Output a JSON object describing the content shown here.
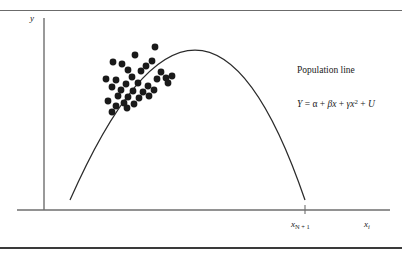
{
  "figure": {
    "axes": {
      "y_label": "y",
      "x_label_main": "x",
      "x_label_main_sub": "i",
      "x_tick_label": "x",
      "x_tick_label_sub": "N + 1"
    },
    "annotations": {
      "curve_caption": "Population line",
      "equation": "Y = α + βx + γx² + U",
      "equation_lhs": "Y",
      "equation_eq": "=",
      "equation_alpha": "α",
      "equation_plus1": "+",
      "equation_beta_x": "βx",
      "equation_plus2": "+",
      "equation_gamma_x": "γx",
      "equation_exponent": "2",
      "equation_plus3": "+",
      "equation_error": "U"
    },
    "colors": {
      "ink": "#1a1a1a",
      "axis": "#6e6e6e",
      "curve": "#2b2b2b",
      "point": "#1a1a1a",
      "rule": "#4a4a4a"
    }
  },
  "chart_data": {
    "type": "scatter",
    "title": "",
    "subtitle": "",
    "xlabel": "x_i",
    "ylabel": "y",
    "grid": false,
    "legend_position": "none",
    "axis_pixel_geometry": {
      "y_axis_x": 44,
      "y_axis_top": 18,
      "y_axis_bottom": 210,
      "x_axis_y": 210,
      "x_axis_left": 17,
      "x_axis_right": 390,
      "x_tick_pixel": 305
    },
    "annotations": [
      {
        "text": "Population line",
        "x": 297,
        "y": 66
      },
      {
        "text": "Y = α + βx + γx² + U",
        "x": 297,
        "y": 99
      }
    ],
    "series": [
      {
        "name": "Population line",
        "type": "line",
        "curve_form": "quadratic",
        "equation": "Y = α + βx + γx² + U",
        "pixel_path": {
          "start": [
            70,
            200
          ],
          "vertex": [
            195,
            50
          ],
          "end": [
            305,
            200
          ]
        },
        "points": [
          [
            70,
            200
          ],
          [
            80,
            172
          ],
          [
            90,
            148
          ],
          [
            100,
            127
          ],
          [
            110,
            109
          ],
          [
            120,
            93
          ],
          [
            130,
            80
          ],
          [
            140,
            70
          ],
          [
            150,
            62
          ],
          [
            160,
            56
          ],
          [
            170,
            52
          ],
          [
            180,
            50
          ],
          [
            190,
            49
          ],
          [
            200,
            50
          ],
          [
            210,
            53
          ],
          [
            220,
            58
          ],
          [
            230,
            65
          ],
          [
            240,
            74
          ],
          [
            250,
            86
          ],
          [
            260,
            100
          ],
          [
            270,
            117
          ],
          [
            280,
            137
          ],
          [
            290,
            160
          ],
          [
            298,
            180
          ],
          [
            305,
            200
          ]
        ]
      },
      {
        "name": "Sample observations",
        "type": "scatter",
        "marker": "filled-circle",
        "marker_size_px": 3.4,
        "count": 34,
        "points": [
          [
            155,
            47
          ],
          [
            135,
            55
          ],
          [
            113,
            62
          ],
          [
            122,
            64
          ],
          [
            146,
            66
          ],
          [
            152,
            61
          ],
          [
            128,
            70
          ],
          [
            141,
            71
          ],
          [
            161,
            72
          ],
          [
            106,
            79
          ],
          [
            116,
            80
          ],
          [
            132,
            77
          ],
          [
            157,
            79
          ],
          [
            166,
            78
          ],
          [
            172,
            76
          ],
          [
            126,
            84
          ],
          [
            138,
            83
          ],
          [
            148,
            86
          ],
          [
            168,
            83
          ],
          [
            112,
            87
          ],
          [
            121,
            90
          ],
          [
            133,
            91
          ],
          [
            143,
            92
          ],
          [
            154,
            90
          ],
          [
            118,
            96
          ],
          [
            128,
            97
          ],
          [
            139,
            98
          ],
          [
            149,
            96
          ],
          [
            108,
            101
          ],
          [
            124,
            103
          ],
          [
            134,
            104
          ],
          [
            116,
            106
          ],
          [
            127,
            108
          ],
          [
            112,
            112
          ]
        ]
      }
    ]
  }
}
